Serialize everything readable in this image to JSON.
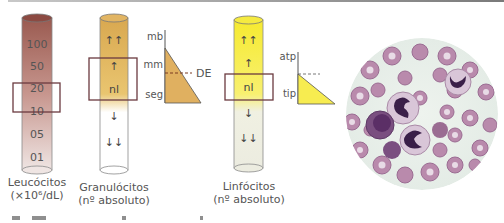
{
  "figure": {
    "leukocytes": {
      "scale": [
        "100",
        "50",
        "20",
        "10",
        "05",
        "01"
      ],
      "label_line1": "Leucócitos",
      "label_line2": "(×10⁶/dL)",
      "colors": {
        "top": "#9a5a50",
        "bottom": "#efe5e3"
      }
    },
    "granulocytes": {
      "scale": [
        "↑↑",
        "↑",
        "nl",
        "↓",
        "↓↓"
      ],
      "label_line1": "Granulócitos",
      "label_line2": "(nº absoluto)",
      "colors": {
        "top": "#d9a850",
        "bottom": "#ffffff"
      },
      "maturation": {
        "levels": [
          "mb",
          "mm",
          "seg"
        ],
        "marker": "DE",
        "fill": "#e0b060"
      }
    },
    "lymphocytes": {
      "scale": [
        "↑↑",
        "↑",
        "nl",
        "↓",
        "↓↓"
      ],
      "label_line1": "Linfócitos",
      "label_line2": "(nº absoluto)",
      "colors": {
        "top": "#f7ec40",
        "bottom": "#f0f0e0"
      },
      "typing": {
        "levels": [
          "atp",
          "tip"
        ],
        "fill": "#f7ec50"
      }
    },
    "micrograph": {
      "description": "blood smear with neutrophils"
    },
    "box_color": "#6b3a3f"
  }
}
